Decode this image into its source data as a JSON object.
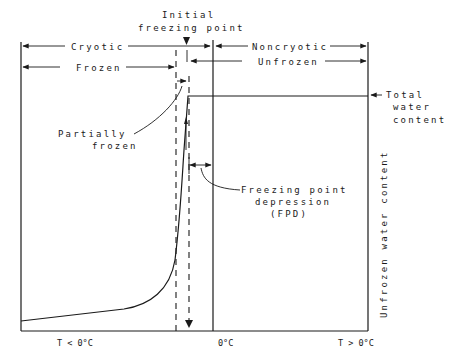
{
  "diagram": {
    "labels": {
      "initial_freezing_point_1": "Initial",
      "initial_freezing_point_2": "freezing point",
      "cryotic": "Cryotic",
      "noncryotic": "Noncryotic",
      "frozen": "Frozen",
      "unfrozen": "Unfrozen",
      "partially_frozen_1": "Partially",
      "partially_frozen_2": "frozen",
      "total_water_1": "Total",
      "total_water_2": "water",
      "total_water_3": "content",
      "fpd_1": "Freezing point",
      "fpd_2": "depression",
      "fpd_3": "(FPD)",
      "y_axis": "Unfrozen water content"
    },
    "x_axis": {
      "left": "T < 0°C",
      "center": "0°C",
      "right": "T > 0°C"
    },
    "colors": {
      "ink": "#1a1a1a",
      "background": "#ffffff"
    }
  }
}
